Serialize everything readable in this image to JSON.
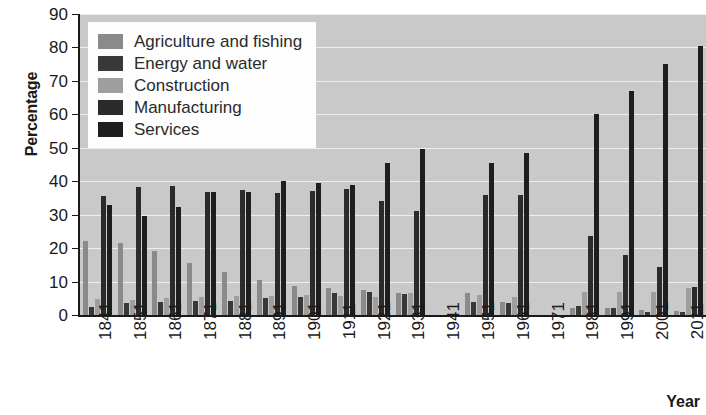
{
  "chart_data": {
    "type": "bar",
    "title": "",
    "xlabel": "Year",
    "ylabel": "Percentage",
    "ylim": [
      0,
      90
    ],
    "ytick_step": 10,
    "yticks": [
      0,
      10,
      20,
      30,
      40,
      50,
      60,
      70,
      80,
      90
    ],
    "grid": true,
    "legend_position": "top-left inside plot",
    "plot_background": "#c9c9c9",
    "gridline_color": "#eeeeee",
    "categories": [
      "1841",
      "1851",
      "1861",
      "1871",
      "1881",
      "1891",
      "1901",
      "1911",
      "1921",
      "1931",
      "1941",
      "1951",
      "1961",
      "1971",
      "1981",
      "1991",
      "2001",
      "2011"
    ],
    "series": [
      {
        "name": "Agriculture and fishing",
        "color": "#8a8a8a",
        "values": [
          22.2,
          21.5,
          19.0,
          15.5,
          13.0,
          10.5,
          8.7,
          8.2,
          7.5,
          6.5,
          null,
          6.5,
          4.0,
          null,
          2.0,
          2.0,
          1.5,
          1.2
        ]
      },
      {
        "name": "Energy and water",
        "color": "#383838",
        "values": [
          2.5,
          3.5,
          4.0,
          4.2,
          4.2,
          5.2,
          5.5,
          6.5,
          6.8,
          6.2,
          null,
          4.0,
          3.5,
          null,
          2.8,
          2.0,
          0.8,
          0.8
        ]
      },
      {
        "name": "Construction",
        "color": "#9e9e9e",
        "values": [
          4.8,
          4.5,
          5.0,
          5.5,
          5.8,
          5.8,
          6.0,
          5.8,
          5.5,
          6.5,
          null,
          6.0,
          5.5,
          null,
          7.0,
          7.0,
          7.0,
          8.2
        ]
      },
      {
        "name": "Manufacturing",
        "color": "#2b2b2b",
        "values": [
          35.5,
          38.2,
          38.5,
          36.8,
          37.5,
          36.5,
          37.2,
          37.8,
          34.2,
          31.2,
          null,
          36.0,
          36.0,
          null,
          23.5,
          18.0,
          14.5,
          8.5
        ]
      },
      {
        "name": "Services",
        "color": "#1e1e1e",
        "values": [
          33.0,
          29.5,
          32.2,
          36.8,
          36.8,
          40.0,
          39.5,
          39.0,
          45.5,
          49.5,
          null,
          45.5,
          48.5,
          null,
          60.0,
          67.0,
          75.2,
          80.5
        ]
      }
    ]
  },
  "axis": {
    "y_title": "Percentage",
    "x_title": "Year"
  },
  "legend": {
    "items": [
      {
        "label": "Agriculture and fishing",
        "color": "#8a8a8a"
      },
      {
        "label": "Energy and water",
        "color": "#383838"
      },
      {
        "label": "Construction",
        "color": "#9e9e9e"
      },
      {
        "label": "Manufacturing",
        "color": "#2b2b2b"
      },
      {
        "label": "Services",
        "color": "#1e1e1e"
      }
    ]
  }
}
